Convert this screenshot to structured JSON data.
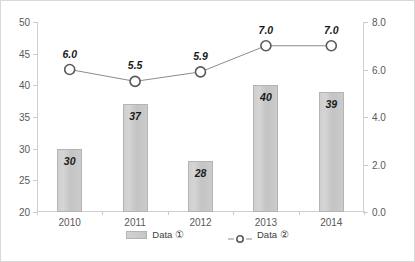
{
  "chart_data": {
    "type": "bar",
    "title": "",
    "subtitle": "",
    "xlabel": "",
    "ylabel": "",
    "categories": [
      "2010",
      "2011",
      "2012",
      "2013",
      "2014"
    ],
    "series": [
      {
        "name": "Data ①",
        "type": "bar",
        "axis": "left",
        "values": [
          30,
          37,
          28,
          40,
          39
        ],
        "labels": [
          "30",
          "37",
          "28",
          "40",
          "39"
        ],
        "color": "#c9c9c9",
        "border_color": "#b4b4b4"
      },
      {
        "name": "Data ②",
        "type": "line",
        "axis": "right",
        "values": [
          6.0,
          5.5,
          5.9,
          7.0,
          7.0
        ],
        "labels": [
          "6.0",
          "5.5",
          "5.9",
          "7.0",
          "7.0"
        ],
        "color": "#808080",
        "marker": "open-circle"
      }
    ],
    "left_axis": {
      "label": "",
      "ylim": [
        20,
        50
      ],
      "ticks": [
        50,
        45,
        40,
        35,
        30,
        25,
        20
      ],
      "tick_labels": [
        "50",
        "45",
        "40",
        "35",
        "30",
        "25",
        "20"
      ]
    },
    "right_axis": {
      "label": "",
      "ylim": [
        0.0,
        8.0
      ],
      "ticks": [
        8.0,
        6.0,
        4.0,
        2.0,
        0.0
      ],
      "tick_labels": [
        "8.0",
        "6.0",
        "4.0",
        "2.0",
        "0.0"
      ]
    },
    "grid": false,
    "legend": {
      "position": "bottom",
      "entries": [
        "Data ①",
        "Data ②"
      ]
    },
    "colors": {
      "bar_fill": "#c9c9c9",
      "bar_border": "#b4b4b4",
      "line": "#808080",
      "marker_fill": "#ffffff",
      "marker_border": "#595959",
      "axis": "#d0d0d0",
      "tick_text": "#595959",
      "data_label_text": "#1a1a1a",
      "frame_border": "#d9d9d9"
    }
  }
}
